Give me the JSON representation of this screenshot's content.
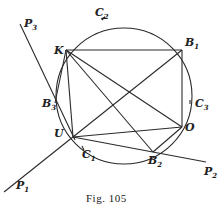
{
  "figure": {
    "caption": "Fig. 105",
    "points": [
      {
        "id": "K",
        "name": "K",
        "sub": ""
      },
      {
        "id": "B1",
        "name": "B",
        "sub": "1"
      },
      {
        "id": "B2",
        "name": "B",
        "sub": "2"
      },
      {
        "id": "B3",
        "name": "B",
        "sub": "3"
      },
      {
        "id": "O",
        "name": "O",
        "sub": ""
      },
      {
        "id": "U",
        "name": "U",
        "sub": ""
      },
      {
        "id": "C1",
        "name": "C",
        "sub": "1"
      },
      {
        "id": "C2",
        "name": "C",
        "sub": "2"
      },
      {
        "id": "C3",
        "name": "C",
        "sub": "3"
      },
      {
        "id": "P1",
        "name": "P",
        "sub": "1"
      },
      {
        "id": "P2",
        "name": "P",
        "sub": "2"
      },
      {
        "id": "P3",
        "name": "P",
        "sub": "3"
      }
    ],
    "segments": [
      [
        "K",
        "B1"
      ],
      [
        "K",
        "O"
      ],
      [
        "K",
        "B2"
      ],
      [
        "K",
        "B3"
      ],
      [
        "B1",
        "O"
      ],
      [
        "B1",
        "U"
      ],
      [
        "U",
        "O"
      ],
      [
        "B2",
        "O"
      ],
      [
        "U",
        "B3"
      ]
    ],
    "lines": [
      [
        "P1",
        "B1"
      ],
      [
        "P2",
        "U"
      ],
      [
        "P3",
        "U"
      ]
    ]
  }
}
